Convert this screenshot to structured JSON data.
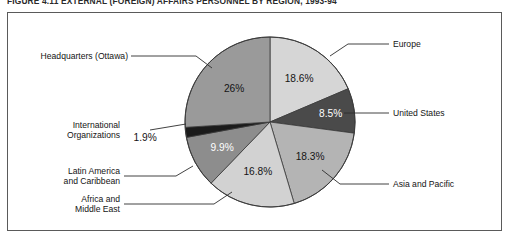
{
  "figure": {
    "caption": "FIGURE 4.11   EXTERNAL (FOREIGN) AFFAIRS PERSONNEL BY REGION, 1993-94"
  },
  "chart_data": {
    "type": "pie",
    "title": "EXTERNAL (FOREIGN) AFFAIRS PERSONNEL BY REGION, 1993-94",
    "legend_position": "callout-labels",
    "categories": [
      "Europe",
      "United States",
      "Asia and Pacific",
      "Africa and Middle East",
      "Latin America and Caribbean",
      "International Organizations",
      "Headquarters (Ottawa)"
    ],
    "values": [
      18.6,
      8.5,
      18.3,
      16.8,
      9.9,
      1.9,
      26
    ],
    "value_labels": [
      "18.6%",
      "8.5%",
      "18.3%",
      "16.8%",
      "9.9%",
      "1.9%",
      "26%"
    ],
    "colors": [
      "#d6d6d6",
      "#4a4a4a",
      "#b4b4b4",
      "#d2d2d2",
      "#8d8d8d",
      "#1b1b1b",
      "#9a9a9a"
    ],
    "units": "percent"
  },
  "slices": [
    {
      "name": "Europe",
      "label": "Europe",
      "value_label": "18.6%",
      "color": "#d6d6d6",
      "text_on_dark": false
    },
    {
      "name": "United States",
      "label": "United States",
      "value_label": "8.5%",
      "color": "#4a4a4a",
      "text_on_dark": true
    },
    {
      "name": "Asia and Pacific",
      "label": "Asia and Pacific",
      "value_label": "18.3%",
      "color": "#b4b4b4",
      "text_on_dark": false
    },
    {
      "name": "Africa and Middle East",
      "label": "Africa and\nMiddle East",
      "value_label": "16.8%",
      "color": "#d2d2d2",
      "text_on_dark": false
    },
    {
      "name": "Latin America and Caribbean",
      "label": "Latin America\nand Caribbean",
      "value_label": "9.9%",
      "color": "#8d8d8d",
      "text_on_dark": true
    },
    {
      "name": "International Organizations",
      "label": "International\nOrganizations",
      "value_label": "1.9%",
      "color": "#1b1b1b",
      "text_on_dark": false
    },
    {
      "name": "Headquarters (Ottawa)",
      "label": "Headquarters (Ottawa)",
      "value_label": "26%",
      "color": "#9a9a9a",
      "text_on_dark": false
    }
  ]
}
